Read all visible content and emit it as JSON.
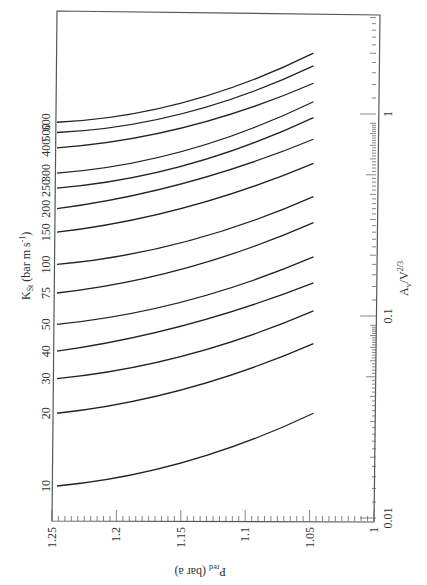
{
  "chart_data": {
    "type": "line",
    "orientation_note": "figure rotated 90 degrees clockwise on page",
    "title": "",
    "xlabel": "P_red (bar a)",
    "ylabel": "A_v/V^(2/3)",
    "series_label": "K_St (bar m s^-1)",
    "xlim": [
      1.25,
      1.0
    ],
    "ylim": [
      0.01,
      3
    ],
    "yscale": "log",
    "x_ticks": [
      "1.25",
      "1.2",
      "1.15",
      "1.1",
      "1.05",
      "1"
    ],
    "y_ticks": [
      "0.01",
      "0.1",
      "1"
    ],
    "x": [
      1.25,
      1.15,
      1.05
    ],
    "series": [
      {
        "name": "10",
        "values": [
          0.0144,
          0.0187,
          0.033
        ]
      },
      {
        "name": "20",
        "values": [
          0.033,
          0.043,
          0.073
        ]
      },
      {
        "name": "30",
        "values": [
          0.049,
          0.063,
          0.106
        ]
      },
      {
        "name": "40",
        "values": [
          0.067,
          0.089,
          0.146
        ]
      },
      {
        "name": "50",
        "values": [
          0.091,
          0.117,
          0.196
        ]
      },
      {
        "name": "75",
        "values": [
          0.13,
          0.17,
          0.29
        ]
      },
      {
        "name": "100",
        "values": [
          0.18,
          0.23,
          0.39
        ]
      },
      {
        "name": "150",
        "values": [
          0.26,
          0.34,
          0.57
        ]
      },
      {
        "name": "200",
        "values": [
          0.34,
          0.45,
          0.75
        ]
      },
      {
        "name": "250",
        "values": [
          0.43,
          0.55,
          0.96
        ]
      },
      {
        "name": "300",
        "values": [
          0.51,
          0.65,
          1.15
        ]
      },
      {
        "name": "400",
        "values": [
          0.68,
          0.85,
          1.42
        ]
      },
      {
        "name": "500",
        "values": [
          0.81,
          1.0,
          1.73
        ]
      },
      {
        "name": "600",
        "values": [
          0.91,
          1.13,
          2.0
        ]
      }
    ],
    "grid": false,
    "legend": "none (curves labeled directly at left edge)"
  },
  "labels": {
    "kst_title": "K",
    "kst_sub": "St",
    "kst_rest": " (bar m s",
    "kst_sup": "-1",
    "kst_close": ")",
    "p_title": "P",
    "p_sub": "red",
    "p_rest": " (bar a)",
    "a_title": "A",
    "a_sub": "v",
    "a_rest": "/V",
    "a_sup": "2/3"
  },
  "x_tick_labels": [
    "1.25",
    "1.2",
    "1.15",
    "1.1",
    "1.05",
    "1"
  ],
  "y_tick_labels": [
    "0.01",
    "0.1",
    "1"
  ],
  "curve_labels": [
    "10",
    "20",
    "30",
    "40",
    "50",
    "75",
    "100",
    "150",
    "200",
    "250",
    "300",
    "400",
    "500",
    "600"
  ]
}
